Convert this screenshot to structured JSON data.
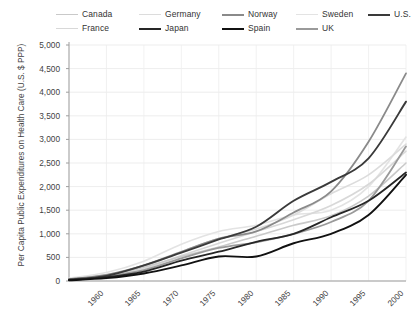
{
  "chart_data": {
    "type": "line",
    "title": "",
    "xlabel": "",
    "ylabel": "Per Capita Public Expenditures on Health Care (U.S. $ PPP)",
    "x": [
      1960,
      1965,
      1970,
      1975,
      1980,
      1985,
      1990,
      1995,
      2000,
      2005
    ],
    "xlim": [
      1960,
      2005
    ],
    "ylim": [
      0,
      5000
    ],
    "yticks": [
      "0",
      "500",
      "1,000",
      "1,500",
      "2,000",
      "2,500",
      "3,000",
      "3,500",
      "4,000",
      "4,500",
      "5,000"
    ],
    "xticks": [
      "1960",
      "1965",
      "1970",
      "1975",
      "1980",
      "1985",
      "1990",
      "1995",
      "2000",
      "2005"
    ],
    "grid": true,
    "legend_position": "top",
    "series": [
      {
        "name": "Canada",
        "color": "#c9c9c9",
        "width": 1.6,
        "values": [
          40,
          120,
          290,
          520,
          720,
          950,
          1180,
          1380,
          1800,
          2500
        ]
      },
      {
        "name": "France",
        "color": "#d8d8d8",
        "width": 1.6,
        "values": [
          35,
          110,
          260,
          540,
          800,
          1050,
          1300,
          1600,
          2050,
          2750
        ]
      },
      {
        "name": "Germany",
        "color": "#dcdcdc",
        "width": 1.6,
        "values": [
          45,
          130,
          300,
          620,
          900,
          1100,
          1400,
          1850,
          2250,
          2900
        ]
      },
      {
        "name": "Japan",
        "color": "#262626",
        "width": 1.8,
        "values": [
          20,
          80,
          200,
          430,
          620,
          830,
          1000,
          1350,
          1700,
          2300
        ]
      },
      {
        "name": "Norway",
        "color": "#8a8a8a",
        "width": 1.8,
        "values": [
          40,
          130,
          330,
          620,
          900,
          1050,
          1450,
          1900,
          2950,
          4400
        ]
      },
      {
        "name": "Spain",
        "color": "#111111",
        "width": 1.9,
        "values": [
          15,
          60,
          160,
          330,
          520,
          520,
          800,
          1000,
          1400,
          2250
        ]
      },
      {
        "name": "Sweden",
        "color": "#e3e3e3",
        "width": 1.6,
        "values": [
          55,
          180,
          420,
          780,
          1050,
          1180,
          1400,
          1500,
          2000,
          3050
        ]
      },
      {
        "name": "UK",
        "color": "#9a9a9a",
        "width": 1.8,
        "values": [
          35,
          100,
          230,
          480,
          700,
          820,
          1000,
          1250,
          1700,
          2850
        ]
      },
      {
        "name": "U.S.",
        "color": "#3a3a3a",
        "width": 1.9,
        "values": [
          30,
          110,
          330,
          600,
          880,
          1150,
          1700,
          2100,
          2600,
          3800
        ]
      }
    ]
  },
  "legend": {
    "row1": [
      {
        "label": "Canada",
        "color": "#c9c9c9",
        "width": 1.6
      },
      {
        "label": "Germany",
        "color": "#dcdcdc",
        "width": 1.6
      },
      {
        "label": "Norway",
        "color": "#8a8a8a",
        "width": 2.0
      },
      {
        "label": "Sweden",
        "color": "#e3e3e3",
        "width": 1.6
      },
      {
        "label": "U.S.",
        "color": "#3a3a3a",
        "width": 2.4
      }
    ],
    "row2": [
      {
        "label": "France",
        "color": "#d8d8d8",
        "width": 1.6
      },
      {
        "label": "Japan",
        "color": "#262626",
        "width": 2.4
      },
      {
        "label": "Spain",
        "color": "#111111",
        "width": 2.4
      },
      {
        "label": "UK",
        "color": "#9a9a9a",
        "width": 2.4
      }
    ]
  }
}
